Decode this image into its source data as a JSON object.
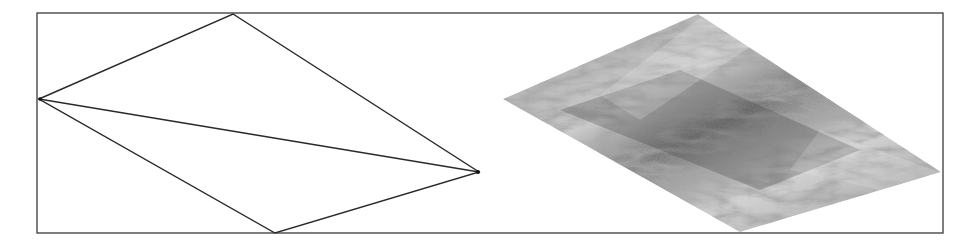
{
  "figure": {
    "frame": {
      "x": 37,
      "y": 13,
      "width": 906,
      "height": 220,
      "stroke": "#3a3a3a"
    },
    "left_panel": {
      "description": "wireframe quadrilateral split into two triangles",
      "vertices": {
        "left": [
          39,
          99
        ],
        "top": [
          233,
          14
        ],
        "right": [
          479,
          172
        ],
        "bottom": [
          275,
          233
        ]
      },
      "stroke": "#2a2a2a"
    },
    "right_panel": {
      "description": "same quadrilateral rendered with a grayscale texture",
      "vertices": {
        "left": [
          503,
          99
        ],
        "top": [
          698,
          14
        ],
        "right": [
          941,
          172
        ],
        "bottom": [
          740,
          232
        ]
      },
      "colors": {
        "dark": "#4a4a4a",
        "mid": "#8a8a8a",
        "light": "#e8e8e8"
      }
    }
  }
}
